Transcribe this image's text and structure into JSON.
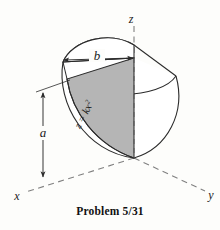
{
  "figure": {
    "caption": "Problem 5/31",
    "axis_labels": {
      "x": "x",
      "y": "y",
      "z": "z"
    },
    "dimensions": {
      "height_label": "a",
      "radius_label": "b"
    },
    "surface_equation": "z = kx",
    "surface_equation_exponent": "2",
    "colors": {
      "background": "#fdfdfb",
      "shaded_fill": "#b5b5b5",
      "outline": "#2b2b2b",
      "dashed_axis": "#7d7d7d",
      "text": "#1a1a1a"
    }
  }
}
